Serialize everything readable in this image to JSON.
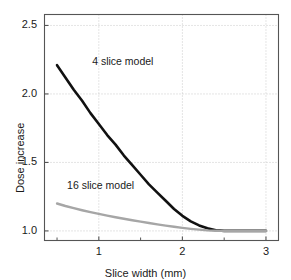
{
  "chart_data": {
    "type": "line",
    "title": "",
    "xlabel": "Slice width (mm)",
    "ylabel": "Dose increase",
    "xlim": [
      0.35,
      3.15
    ],
    "ylim": [
      0.93,
      2.58
    ],
    "xticks": [
      1,
      2,
      3
    ],
    "xtick_labels": [
      "1",
      "2",
      "3"
    ],
    "xminorticks": [
      0.5,
      1.5,
      2.5
    ],
    "yticks": [
      1.0,
      1.5,
      2.0,
      2.5
    ],
    "ytick_labels": [
      "1.0",
      "1.5",
      "2.0",
      "2.5"
    ],
    "grid": true,
    "grid_style": "dotted",
    "legend": "inline-annotations",
    "series": [
      {
        "name": "4 slice model",
        "color": "#111111",
        "width": 2.6,
        "label_x": 0.92,
        "label_y": 2.23,
        "x": [
          0.5,
          0.6,
          0.7,
          0.8,
          0.9,
          1.0,
          1.1,
          1.2,
          1.3,
          1.4,
          1.5,
          1.6,
          1.7,
          1.8,
          1.9,
          2.0,
          2.1,
          2.2,
          2.3,
          2.4,
          2.5,
          2.6,
          2.7,
          2.8,
          2.9,
          3.0
        ],
        "y": [
          2.21,
          2.12,
          2.03,
          1.95,
          1.86,
          1.78,
          1.7,
          1.63,
          1.55,
          1.48,
          1.41,
          1.34,
          1.28,
          1.22,
          1.16,
          1.11,
          1.07,
          1.04,
          1.02,
          1.005,
          1.0,
          1.0,
          1.0,
          1.0,
          1.0,
          1.0
        ]
      },
      {
        "name": "16 slice model",
        "color": "#a6a6a6",
        "width": 2.4,
        "label_x": 0.62,
        "label_y": 1.33,
        "x": [
          0.5,
          0.6,
          0.7,
          0.8,
          0.9,
          1.0,
          1.1,
          1.2,
          1.3,
          1.4,
          1.5,
          1.6,
          1.7,
          1.8,
          1.9,
          2.0,
          2.1,
          2.2,
          2.3,
          2.4,
          2.5,
          2.6,
          2.7,
          2.8,
          2.9,
          3.0
        ],
        "y": [
          1.2,
          1.182,
          1.166,
          1.151,
          1.137,
          1.124,
          1.112,
          1.1,
          1.089,
          1.078,
          1.068,
          1.058,
          1.048,
          1.039,
          1.03,
          1.022,
          1.015,
          1.009,
          1.004,
          1.001,
          1.0,
          1.0,
          1.0,
          1.0,
          1.0,
          1.0
        ]
      }
    ],
    "colors": {
      "axis": "#555555",
      "grid": "#bdbdbd",
      "text": "#1a1a1a",
      "background": "#ffffff"
    }
  }
}
